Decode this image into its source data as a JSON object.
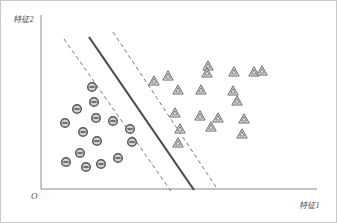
{
  "figure": {
    "type": "svm-margin-diagram",
    "background_color": "#ffffff",
    "border_color": "#c8c8c8"
  },
  "axes": {
    "origin_label": "O",
    "x_label": "特征1",
    "y_label": "特征2",
    "axis_color": "#8a8a8a",
    "x_axis": {
      "x1": 40,
      "y1": 188,
      "x2": 316,
      "y2": 188
    },
    "y_axis": {
      "x1": 40,
      "y1": 188,
      "x2": 40,
      "y2": 14
    }
  },
  "chart_data": {
    "type": "scatter",
    "title": "",
    "xlabel": "特征1",
    "ylabel": "特征2",
    "grid": false,
    "legend_position": "none",
    "xlim": [
      40,
      316
    ],
    "ylim": [
      14,
      188
    ],
    "series": [
      {
        "name": "负类",
        "marker": "circle-minus",
        "color": "#595959",
        "fill": "#cfcfcf",
        "points": [
          [
            91,
            86
          ],
          [
            93,
            101
          ],
          [
            76,
            108
          ],
          [
            64,
            122
          ],
          [
            95,
            117
          ],
          [
            82,
            131
          ],
          [
            112,
            120
          ],
          [
            129,
            128
          ],
          [
            96,
            140
          ],
          [
            79,
            152
          ],
          [
            131,
            141
          ],
          [
            85,
            166
          ],
          [
            65,
            161
          ],
          [
            100,
            163
          ],
          [
            117,
            157
          ]
        ]
      },
      {
        "name": "正类",
        "marker": "triangle-outline",
        "color": "#6e6e6e",
        "fill": "#e3e3e3",
        "points": [
          [
            167,
            75
          ],
          [
            153,
            80
          ],
          [
            177,
            89
          ],
          [
            174,
            112
          ],
          [
            207,
            65
          ],
          [
            200,
            89
          ],
          [
            199,
            115
          ],
          [
            210,
            126
          ],
          [
            179,
            128
          ],
          [
            177,
            142
          ],
          [
            206,
            72
          ],
          [
            233,
            71
          ],
          [
            232,
            90
          ],
          [
            236,
            100
          ],
          [
            217,
            117
          ],
          [
            243,
            118
          ],
          [
            253,
            71
          ],
          [
            261,
            70
          ],
          [
            241,
            133
          ]
        ]
      }
    ],
    "lines": [
      {
        "name": "决策边界",
        "style": "solid",
        "color": "#4d4d4d",
        "width": 2.2,
        "x1": 88,
        "y1": 36,
        "x2": 193,
        "y2": 189
      },
      {
        "name": "下间隔边界",
        "style": "dashed",
        "color": "#7a7a7a",
        "width": 1,
        "x1": 63,
        "y1": 38,
        "x2": 170,
        "y2": 190
      },
      {
        "name": "上间隔边界",
        "style": "dashed",
        "color": "#7a7a7a",
        "width": 1,
        "x1": 112,
        "y1": 31,
        "x2": 215,
        "y2": 186
      }
    ]
  }
}
